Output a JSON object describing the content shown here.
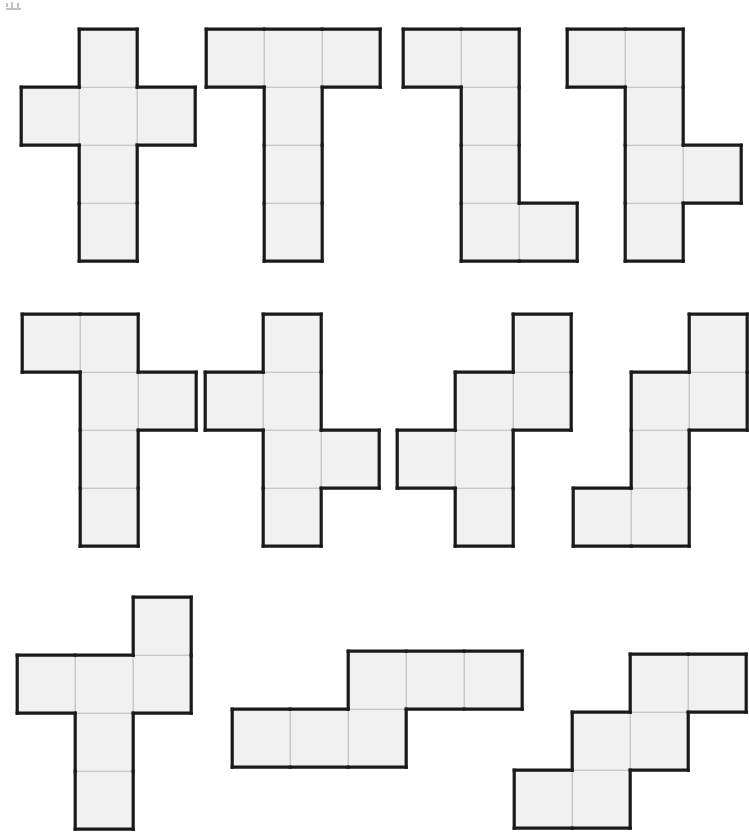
{
  "page": {
    "background_color": "#ffffff",
    "width": 749,
    "height": 837
  },
  "style": {
    "cell_size": 58,
    "fill_color": "#f1f1f1",
    "outline_color": "#1a1a1a",
    "outline_width": 3.2,
    "gridline_color": "#b9b9b9",
    "gridline_width": 1.1
  },
  "figures": [
    {
      "id": "net-1",
      "label": "plus-cross net",
      "origin_x": 18,
      "origin_y": 26,
      "cols": 3,
      "rows": 4,
      "cells": [
        [
          1,
          0
        ],
        [
          0,
          1
        ],
        [
          1,
          1
        ],
        [
          2,
          1
        ],
        [
          1,
          2
        ],
        [
          1,
          3
        ]
      ]
    },
    {
      "id": "net-2",
      "label": "tee net",
      "origin_x": 203,
      "origin_y": 26,
      "cols": 3,
      "rows": 4,
      "cells": [
        [
          0,
          0
        ],
        [
          1,
          0
        ],
        [
          2,
          0
        ],
        [
          1,
          1
        ],
        [
          1,
          2
        ],
        [
          1,
          3
        ]
      ]
    },
    {
      "id": "net-3",
      "label": "zee net",
      "origin_x": 400,
      "origin_y": 26,
      "cols": 3,
      "rows": 4,
      "cells": [
        [
          0,
          0
        ],
        [
          1,
          0
        ],
        [
          1,
          1
        ],
        [
          1,
          2
        ],
        [
          1,
          3
        ],
        [
          2,
          3
        ]
      ]
    },
    {
      "id": "net-4",
      "label": "ess net",
      "origin_x": 564,
      "origin_y": 26,
      "cols": 3,
      "rows": 4,
      "cells": [
        [
          0,
          0
        ],
        [
          1,
          0
        ],
        [
          1,
          1
        ],
        [
          1,
          2
        ],
        [
          2,
          2
        ],
        [
          1,
          3
        ]
      ]
    },
    {
      "id": "net-5",
      "label": "offset tee net",
      "origin_x": 19,
      "origin_y": 311,
      "cols": 3,
      "rows": 4,
      "cells": [
        [
          0,
          0
        ],
        [
          1,
          0
        ],
        [
          1,
          1
        ],
        [
          2,
          1
        ],
        [
          1,
          2
        ],
        [
          1,
          3
        ]
      ]
    },
    {
      "id": "net-6",
      "label": "staggered cross net",
      "origin_x": 202,
      "origin_y": 311,
      "cols": 3,
      "rows": 4,
      "cells": [
        [
          1,
          0
        ],
        [
          0,
          1
        ],
        [
          1,
          1
        ],
        [
          1,
          2
        ],
        [
          2,
          2
        ],
        [
          1,
          3
        ]
      ]
    },
    {
      "id": "net-7",
      "label": "stair cross net",
      "origin_x": 394,
      "origin_y": 311,
      "cols": 3,
      "rows": 4,
      "cells": [
        [
          2,
          0
        ],
        [
          1,
          1
        ],
        [
          2,
          1
        ],
        [
          0,
          2
        ],
        [
          1,
          2
        ],
        [
          1,
          3
        ]
      ]
    },
    {
      "id": "net-8",
      "label": "stepped zigzag net",
      "origin_x": 570,
      "origin_y": 311,
      "cols": 3,
      "rows": 4,
      "cells": [
        [
          2,
          0
        ],
        [
          1,
          1
        ],
        [
          2,
          1
        ],
        [
          1,
          2
        ],
        [
          0,
          3
        ],
        [
          1,
          3
        ]
      ]
    },
    {
      "id": "net-9",
      "label": "tall cross net",
      "origin_x": 14,
      "origin_y": 594,
      "cols": 3,
      "rows": 4,
      "cells": [
        [
          2,
          0
        ],
        [
          0,
          1
        ],
        [
          1,
          1
        ],
        [
          2,
          1
        ],
        [
          1,
          2
        ],
        [
          1,
          3
        ]
      ]
    },
    {
      "id": "net-10",
      "label": "offset strip net",
      "origin_x": 229,
      "origin_y": 648,
      "cols": 5,
      "rows": 2,
      "cells": [
        [
          2,
          0
        ],
        [
          3,
          0
        ],
        [
          4,
          0
        ],
        [
          0,
          1
        ],
        [
          1,
          1
        ],
        [
          2,
          1
        ]
      ]
    },
    {
      "id": "net-11",
      "label": "staircase net",
      "origin_x": 511,
      "origin_y": 651,
      "cols": 4,
      "rows": 3,
      "cells": [
        [
          2,
          0
        ],
        [
          3,
          0
        ],
        [
          1,
          1
        ],
        [
          2,
          1
        ],
        [
          0,
          2
        ],
        [
          1,
          2
        ]
      ]
    }
  ]
}
